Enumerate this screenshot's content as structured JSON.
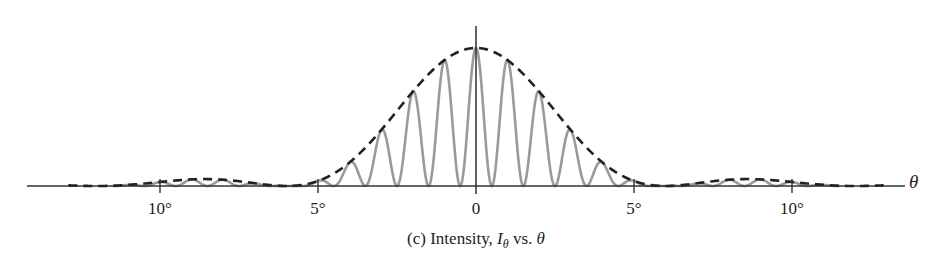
{
  "chart_data": {
    "type": "line",
    "title": "",
    "caption": {
      "prefix": "(c) Intensity, ",
      "var": "I",
      "sub": "θ",
      "suffix": " vs. ",
      "xvar": "θ"
    },
    "xlabel": "θ",
    "ylabel": "",
    "xlim": [
      -14,
      13.5
    ],
    "ylim": [
      0,
      1
    ],
    "grid": false,
    "legend": null,
    "x_ticks": [
      {
        "value": -10,
        "label": "10°"
      },
      {
        "value": -5,
        "label": "5°"
      },
      {
        "value": 0,
        "label": "0"
      },
      {
        "value": 5,
        "label": "5°"
      },
      {
        "value": 10,
        "label": "10°"
      }
    ],
    "series": [
      {
        "name": "Intensity I_θ (interference fringes)",
        "style": "solid",
        "color": "#9a9a9a",
        "fringe_spacing_deg": 1.0,
        "description": "cos² fringes with maxima every 1°, modulated by single-slit envelope"
      },
      {
        "name": "Single-slit diffraction envelope",
        "style": "dashed",
        "color": "#222222",
        "first_zero_deg": 6.0,
        "secondary_max_deg": 9.0,
        "secondary_max_rel": 0.05,
        "peak_rel": 1.0
      }
    ],
    "envelope_samples": {
      "x": [
        -13,
        -12,
        -11,
        -10,
        -9,
        -8,
        -7,
        -6,
        -5,
        -4,
        -3,
        -2,
        -1,
        0,
        1,
        2,
        3,
        4,
        5,
        6,
        7,
        8,
        9,
        10,
        11,
        12,
        13
      ],
      "y": [
        0.02,
        0.0,
        0.02,
        0.04,
        0.05,
        0.04,
        0.02,
        0.0,
        0.06,
        0.22,
        0.44,
        0.67,
        0.87,
        1.0,
        0.87,
        0.67,
        0.44,
        0.22,
        0.06,
        0.0,
        0.02,
        0.04,
        0.05,
        0.04,
        0.02,
        0.0,
        0.02
      ]
    }
  }
}
